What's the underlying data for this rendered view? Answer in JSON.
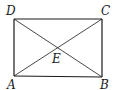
{
  "diagram": {
    "type": "rectangle-with-diagonals",
    "colors": {
      "stroke": "#1a1a1a",
      "background": "#ffffff"
    },
    "points": {
      "A": {
        "label": "A",
        "x": 14,
        "y": 76
      },
      "B": {
        "label": "B",
        "x": 102,
        "y": 77
      },
      "C": {
        "label": "C",
        "x": 102,
        "y": 19
      },
      "D": {
        "label": "D",
        "x": 14,
        "y": 19
      },
      "E": {
        "label": "E",
        "x": 58,
        "y": 47
      }
    },
    "segments": [
      "AB",
      "BC",
      "CD",
      "DA",
      "AC",
      "BD"
    ],
    "labels": {
      "A": "A",
      "B": "B",
      "C": "C",
      "D": "D",
      "E": "E"
    }
  }
}
